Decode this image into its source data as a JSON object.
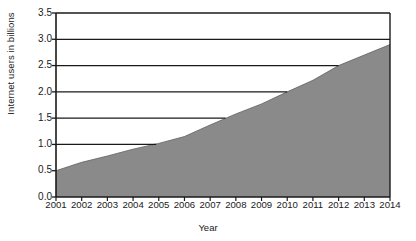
{
  "chart_data": {
    "type": "area",
    "title": "",
    "xlabel": "Year",
    "ylabel": "Internet users in billions",
    "x": [
      2001,
      2002,
      2003,
      2004,
      2005,
      2006,
      2007,
      2008,
      2009,
      2010,
      2011,
      2012,
      2013,
      2014
    ],
    "values": [
      0.5,
      0.66,
      0.78,
      0.91,
      1.02,
      1.15,
      1.37,
      1.58,
      1.77,
      2.0,
      2.22,
      2.5,
      2.7,
      2.9
    ],
    "series": [
      {
        "name": "Internet users",
        "values": [
          0.5,
          0.66,
          0.78,
          0.91,
          1.02,
          1.15,
          1.37,
          1.58,
          1.77,
          2.0,
          2.22,
          2.5,
          2.7,
          2.9
        ]
      }
    ],
    "xlim": [
      2001,
      2014
    ],
    "ylim": [
      0.0,
      3.5
    ],
    "ytick_labels": [
      "0.0",
      "0.5",
      "1.0",
      "1.5",
      "2.0",
      "2.5",
      "3.0",
      "3.5"
    ],
    "ytick_values": [
      0.0,
      0.5,
      1.0,
      1.5,
      2.0,
      2.5,
      3.0,
      3.5
    ],
    "xtick_labels": [
      "2001",
      "2002",
      "2003",
      "2004",
      "2005",
      "2006",
      "2007",
      "2008",
      "2009",
      "2010",
      "2011",
      "2012",
      "2013",
      "2014"
    ],
    "grid": true,
    "gridlines": [
      {
        "y": 0.5,
        "x_end": 2001.0
      },
      {
        "y": 1.0,
        "x_end": 2004.9
      },
      {
        "y": 1.5,
        "x_end": 2007.6
      },
      {
        "y": 2.0,
        "x_end": 2010.0
      },
      {
        "y": 2.5,
        "x_end": 2012.0
      },
      {
        "y": 3.0,
        "x_end": 2014.0
      }
    ],
    "legend": "none",
    "legend_position": "none",
    "area_color": "#8a8a8a",
    "line_color": "#1a1a1a",
    "grid_color": "#1a1a1a",
    "background_color": "#ffffff"
  }
}
